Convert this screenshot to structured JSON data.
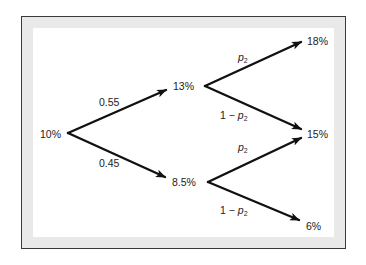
{
  "diagram": {
    "type": "binomial-tree",
    "nodes": {
      "root": "10%",
      "up": "13%",
      "down": "8.5%",
      "upup": "18%",
      "middle": "15%",
      "downdown": "6%"
    },
    "edges": {
      "root_up_prob": "0.55",
      "root_down_prob": "0.45",
      "up_up_prob_var": "p",
      "up_up_prob_sub": "2",
      "up_mid_prefix": "1 − ",
      "up_mid_var": "p",
      "up_mid_sub": "2",
      "down_mid_var": "p",
      "down_mid_sub": "2",
      "down_down_prefix": "1 − ",
      "down_down_var": "p",
      "down_down_sub": "2"
    }
  }
}
